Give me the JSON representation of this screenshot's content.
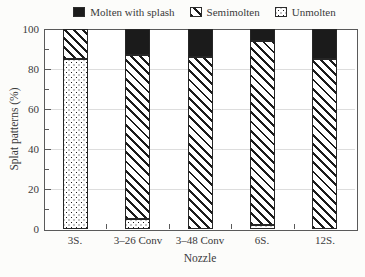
{
  "figure": {
    "background": "#fcfcfa",
    "text_color": "#3a3a3a"
  },
  "legend": {
    "items": [
      {
        "label": "Molten with splash",
        "pattern": "solid",
        "swatch_icon": "solid-black-square-icon"
      },
      {
        "label": "Semimolten",
        "pattern": "hatch",
        "swatch_icon": "diagonal-hatch-square-icon"
      },
      {
        "label": "Unmolten",
        "pattern": "dots",
        "swatch_icon": "dotted-square-icon"
      }
    ]
  },
  "chart_data": {
    "type": "bar",
    "stacked": true,
    "title": "",
    "xlabel": "Nozzle",
    "ylabel": "Splat patterns (%)",
    "ylim": [
      0,
      100
    ],
    "yticks": [
      0,
      20,
      40,
      60,
      80,
      100
    ],
    "yticks_minor": [
      10,
      30,
      50,
      70,
      90
    ],
    "grid": "horizontal gridlines at major y ticks",
    "legend_position": "top",
    "categories": [
      "3S.",
      "3–26 Conv",
      "3–48 Conv",
      "6S.",
      "12S."
    ],
    "series": [
      {
        "name": "Unmolten",
        "pattern": "dots",
        "values": [
          85,
          5,
          0,
          2,
          0
        ]
      },
      {
        "name": "Semimolten",
        "pattern": "hatch",
        "values": [
          15,
          82,
          86,
          92,
          85
        ]
      },
      {
        "name": "Molten with splash",
        "pattern": "solid",
        "values": [
          0,
          13,
          14,
          6,
          15
        ]
      }
    ],
    "colors": {
      "ink": "#1b1b1b",
      "grid": "#dddddd",
      "frame": "#5a5a5a",
      "text": "#3a3a3a",
      "background": "#fcfcfa"
    }
  }
}
